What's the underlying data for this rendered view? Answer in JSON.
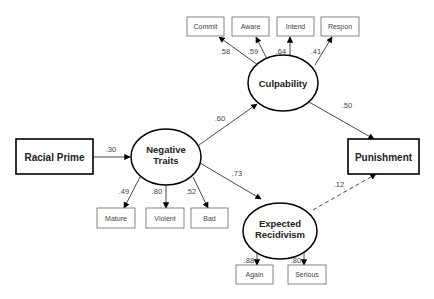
{
  "diagram": {
    "type": "structural-equation-model",
    "nodes": {
      "racial_prime": {
        "label": "Racial Prime",
        "shape": "box-bold"
      },
      "negative_traits": {
        "label_line1": "Negative",
        "label_line2": "Traits",
        "shape": "ellipse"
      },
      "culpability": {
        "label": "Culpability",
        "shape": "ellipse"
      },
      "expected_recidivism": {
        "label_line1": "Expected",
        "label_line2": "Recidivism",
        "shape": "ellipse"
      },
      "punishment": {
        "label": "Punishment",
        "shape": "box-bold"
      },
      "commit": {
        "label": "Commit",
        "shape": "box"
      },
      "aware": {
        "label": "Aware",
        "shape": "box"
      },
      "intend": {
        "label": "Intend",
        "shape": "box"
      },
      "respon": {
        "label": "Respon",
        "shape": "box"
      },
      "mature": {
        "label": "Mature",
        "shape": "box"
      },
      "violent": {
        "label": "Violent",
        "shape": "box"
      },
      "bad": {
        "label": "Bad",
        "shape": "box"
      },
      "again": {
        "label": "Again",
        "shape": "box"
      },
      "serious": {
        "label": "Serious",
        "shape": "box"
      }
    },
    "paths": {
      "racial_prime_to_negative_traits": ".30",
      "negative_traits_to_culpability": ".60",
      "negative_traits_to_expected_recidivism": ".73",
      "culpability_to_punishment": ".50",
      "expected_recidivism_to_punishment": ".12",
      "culpability_to_commit": ".58",
      "culpability_to_aware": ".59",
      "culpability_to_intend": ".64",
      "culpability_to_respon": ".41",
      "negative_traits_to_mature": ".49",
      "negative_traits_to_violent": ".80",
      "negative_traits_to_bad": ".52",
      "expected_recidivism_to_again": ".88",
      "expected_recidivism_to_serious": ".80"
    },
    "styles": {
      "stroke": "#000000",
      "text": "#222222",
      "indicator_stroke": "#555555",
      "dashed_path": "expected_recidivism_to_punishment"
    }
  }
}
